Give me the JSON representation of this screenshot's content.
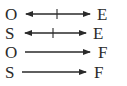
{
  "diagram": {
    "rows": [
      {
        "left": "O",
        "right": "E",
        "arrow": "bidirectional",
        "crossed": true
      },
      {
        "left": "S",
        "right": "E",
        "arrow": "bidirectional",
        "crossed": true
      },
      {
        "left": "O",
        "right": "F",
        "arrow": "right",
        "crossed": false
      },
      {
        "left": "S",
        "right": "F",
        "arrow": "right",
        "crossed": false
      }
    ],
    "color": "#2a2a2a"
  }
}
